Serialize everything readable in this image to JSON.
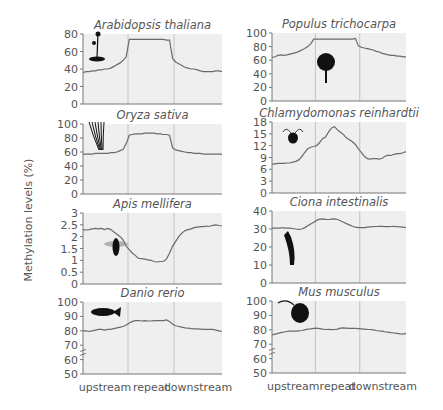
{
  "figure": {
    "ylabel": "Methylation levels (%)",
    "colors": {
      "plot_bg": "#efefef",
      "line": "#6a6a6a",
      "axis": "#777777",
      "divider": "#b8b8b8",
      "text": "#555555",
      "icon": "#111111"
    }
  },
  "chart_data": [
    {
      "type": "line",
      "title": "Arabidopsis thaliana",
      "icon": "plant-icon",
      "ylim": [
        0,
        80
      ],
      "yticks": [
        "0",
        "20",
        "40",
        "60",
        "80"
      ],
      "broken_axis": false,
      "xlabels": [],
      "regions": [
        "upstream",
        "repeat",
        "downstream"
      ],
      "values": [
        36,
        37,
        37,
        38,
        38,
        39,
        39,
        40,
        40,
        41,
        43,
        45,
        47,
        50,
        54,
        74,
        74,
        74,
        74,
        74,
        74,
        74,
        74,
        74,
        74,
        74,
        74,
        73,
        73,
        52,
        48,
        46,
        44,
        42,
        41,
        40,
        40,
        39,
        38,
        37,
        37,
        37,
        37,
        38,
        38,
        37
      ]
    },
    {
      "type": "line",
      "title": "Populus trichocarpa",
      "icon": "tree-icon",
      "ylim": [
        0,
        100
      ],
      "yticks": [
        "0",
        "20",
        "40",
        "60",
        "80",
        "100"
      ],
      "broken_axis": false,
      "xlabels": [],
      "regions": [
        "upstream",
        "repeat",
        "downstream"
      ],
      "values": [
        64,
        65,
        67,
        68,
        67,
        68,
        69,
        70,
        71,
        73,
        75,
        77,
        80,
        84,
        91,
        91,
        91,
        91,
        91,
        91,
        91,
        91,
        91,
        91,
        91,
        91,
        91,
        91,
        92,
        81,
        79,
        78,
        77,
        76,
        75,
        73,
        72,
        70,
        69,
        68,
        67,
        67,
        66,
        66,
        65,
        65
      ]
    },
    {
      "type": "line",
      "title": "Oryza sativa",
      "icon": "rice-icon",
      "ylim": [
        0,
        100
      ],
      "yticks": [
        "0",
        "20",
        "40",
        "60",
        "80",
        "100"
      ],
      "broken_axis": false,
      "xlabels": [],
      "regions": [
        "upstream",
        "repeat",
        "downstream"
      ],
      "values": [
        57,
        57,
        57,
        57,
        58,
        58,
        58,
        58,
        58,
        59,
        59,
        60,
        62,
        64,
        72,
        84,
        85,
        86,
        86,
        86,
        87,
        87,
        87,
        87,
        86,
        86,
        85,
        85,
        84,
        66,
        63,
        62,
        61,
        60,
        59,
        59,
        58,
        58,
        58,
        57,
        57,
        57,
        57,
        57,
        57,
        57
      ]
    },
    {
      "type": "line",
      "title": "Chlamydomonas reinhardtii",
      "icon": "alga-icon",
      "ylim": [
        0,
        18
      ],
      "yticks": [
        "0",
        "3",
        "6",
        "9",
        "12",
        "15",
        "18"
      ],
      "broken_axis": false,
      "xlabels": [],
      "regions": [
        "upstream",
        "repeat",
        "downstream"
      ],
      "values": [
        7.3,
        7.4,
        7.5,
        7.5,
        7.5,
        7.6,
        7.6,
        7.8,
        8.0,
        8.4,
        9.2,
        10.3,
        11.2,
        11.6,
        11.8,
        12.0,
        12.8,
        13.8,
        14.2,
        15.5,
        16.5,
        16.8,
        16.0,
        15.4,
        14.8,
        14.0,
        13.5,
        13.0,
        12.3,
        11.2,
        10.3,
        9.3,
        8.7,
        8.6,
        8.7,
        8.7,
        8.6,
        8.8,
        9.3,
        9.6,
        9.5,
        9.8,
        10.0,
        10.0,
        10.2,
        10.5
      ]
    },
    {
      "type": "line",
      "title": "Apis mellifera",
      "icon": "bee-icon",
      "ylim": [
        0,
        3
      ],
      "yticks": [
        "0",
        "0.5",
        "1",
        "1.5",
        "2",
        "2.5",
        "3"
      ],
      "broken_axis": false,
      "xlabels": [],
      "regions": [
        "upstream",
        "repeat",
        "downstream"
      ],
      "values": [
        2.3,
        2.28,
        2.3,
        2.33,
        2.35,
        2.33,
        2.35,
        2.3,
        2.35,
        2.3,
        2.2,
        2.1,
        2.0,
        1.85,
        1.6,
        1.45,
        1.3,
        1.2,
        1.08,
        1.07,
        1.05,
        1.02,
        1.0,
        0.95,
        0.93,
        0.95,
        0.95,
        1.05,
        1.3,
        1.6,
        1.8,
        2.0,
        2.15,
        2.25,
        2.3,
        2.33,
        2.38,
        2.4,
        2.42,
        2.42,
        2.45,
        2.43,
        2.48,
        2.5,
        2.47,
        2.45
      ]
    },
    {
      "type": "line",
      "title": "Ciona intestinalis",
      "icon": "tunicate-icon",
      "ylim": [
        0,
        40
      ],
      "yticks": [
        "0",
        "10",
        "20",
        "30",
        "40"
      ],
      "broken_axis": false,
      "xlabels": [],
      "regions": [
        "upstream",
        "repeat",
        "downstream"
      ],
      "values": [
        30.5,
        30.5,
        30.5,
        30.6,
        30.6,
        30.5,
        30.5,
        30.3,
        30.0,
        29.8,
        30.0,
        30.8,
        31.8,
        32.8,
        33.8,
        34.8,
        35.5,
        35.6,
        35.4,
        35.3,
        35.5,
        35.6,
        35.3,
        34.6,
        33.8,
        33.0,
        32.3,
        31.5,
        31.0,
        30.8,
        30.7,
        30.8,
        31.0,
        31.2,
        31.3,
        31.4,
        31.5,
        31.5,
        31.3,
        31.3,
        31.4,
        31.5,
        31.3,
        31.2,
        31.0,
        30.8
      ]
    },
    {
      "type": "line",
      "title": "Danio rerio",
      "icon": "fish-icon",
      "ylim": [
        50,
        100
      ],
      "yticks": [
        "50",
        "60",
        "70",
        "80",
        "90",
        "100"
      ],
      "broken_axis": true,
      "xlabels": [
        "upstream",
        "repeat",
        "downstream"
      ],
      "regions": [
        "upstream",
        "repeat",
        "downstream"
      ],
      "values": [
        80,
        80,
        79.5,
        80,
        80.5,
        81,
        81,
        80.5,
        81,
        81,
        81.5,
        82,
        82.5,
        83,
        84,
        85.5,
        86.5,
        87,
        87,
        86.8,
        87,
        86.8,
        86.8,
        87,
        87,
        87,
        87,
        87.5,
        86.5,
        84.5,
        83.5,
        83,
        82.5,
        82,
        81.8,
        81.5,
        81.3,
        81.3,
        81.2,
        81,
        81,
        81,
        81,
        80.5,
        80,
        79.5
      ]
    },
    {
      "type": "line",
      "title": "Mus musculus",
      "icon": "mouse-icon",
      "ylim": [
        50,
        100
      ],
      "yticks": [
        "50",
        "60",
        "70",
        "80",
        "90",
        "100"
      ],
      "broken_axis": true,
      "xlabels": [
        "upstream",
        "repeat",
        "downstream"
      ],
      "regions": [
        "upstream",
        "repeat",
        "downstream"
      ],
      "values": [
        76.5,
        77,
        77.5,
        78,
        78.5,
        78.8,
        79,
        79,
        79,
        79.3,
        79.5,
        80,
        80.5,
        80.7,
        81,
        81.2,
        80.8,
        80.5,
        80.2,
        80.3,
        80.1,
        80.2,
        80.5,
        81.2,
        81.3,
        81.2,
        81,
        81,
        81,
        80.8,
        80.7,
        80.5,
        80.3,
        80.2,
        80,
        79.5,
        79.2,
        79,
        78.5,
        78.3,
        78,
        77.8,
        77.5,
        77.2,
        77,
        77.5
      ]
    }
  ]
}
